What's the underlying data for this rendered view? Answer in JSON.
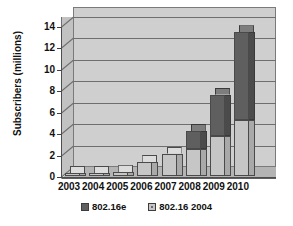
{
  "chart_data": {
    "type": "bar",
    "subtype": "stacked-3d-column",
    "title": "",
    "xlabel": "",
    "ylabel": "Subscribers (millions)",
    "categories": [
      "2003",
      "2004",
      "2005",
      "2006",
      "2007",
      "2008",
      "2009",
      "2010"
    ],
    "series": [
      {
        "name": "802.16 2004",
        "color": "#c6c6c6",
        "values": [
          0.05,
          0.15,
          0.35,
          1.3,
          2.1,
          2.5,
          3.7,
          5.2
        ]
      },
      {
        "name": "802.16e",
        "color": "#5f5f5f",
        "values": [
          0,
          0,
          0,
          0,
          0,
          1.7,
          3.9,
          8.2
        ]
      }
    ],
    "totals": [
      0.05,
      0.15,
      0.35,
      1.3,
      2.1,
      4.2,
      7.6,
      13.4
    ],
    "yticks": [
      0,
      2,
      4,
      6,
      8,
      10,
      12,
      14
    ],
    "ylim": [
      0,
      14
    ],
    "grid": true,
    "legend_position": "bottom",
    "stack_order_bottom_to_top": [
      "802.16 2004",
      "802.16e"
    ]
  },
  "axis": {
    "y_title": "Subscribers (millions)",
    "y_tick_labels": [
      "14",
      "12",
      "10",
      "8",
      "6",
      "4",
      "2",
      "0"
    ],
    "x_tick_labels": [
      "2003",
      "2004",
      "2005",
      "2006",
      "2007",
      "2008",
      "2009",
      "2010"
    ]
  },
  "legend": {
    "items": [
      {
        "label": "802.16e",
        "swatch": "dark-swatch-icon"
      },
      {
        "label": "802.16 2004",
        "swatch": "light-swatch-icon"
      }
    ]
  },
  "colors": {
    "plot_background": "#cfcfcf",
    "floor": "#b4b4b4",
    "gridline": "#6e6e6e",
    "series_dark": "#5f5f5f",
    "series_light": "#c6c6c6",
    "text": "#111111",
    "page_background": "#ffffff"
  }
}
